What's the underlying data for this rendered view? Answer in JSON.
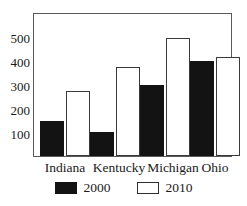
{
  "chart_data": {
    "type": "bar",
    "title": "",
    "subtitle": "",
    "xlabel": "",
    "ylabel": "",
    "categories": [
      "Indiana",
      "Kentucky",
      "Michigan",
      "Ohio"
    ],
    "series": [
      {
        "name": "2000",
        "values": [
          150,
          100,
          300,
          400
        ],
        "color": "#131313",
        "fill": "solid"
      },
      {
        "name": "2010",
        "values": [
          275,
          375,
          500,
          420
        ],
        "color": "#ffffff",
        "fill": "outline"
      }
    ],
    "ylim": [
      0,
      600
    ],
    "yticks": [
      100,
      200,
      300,
      400,
      500
    ],
    "ytick_labels": [
      "100",
      "200",
      "300",
      "400",
      "500"
    ],
    "grid": false,
    "legend_position": "bottom",
    "frame": true
  },
  "axes": {
    "y": {
      "ticks": [
        {
          "label": "500",
          "value": 500
        },
        {
          "label": "400",
          "value": 400
        },
        {
          "label": "300",
          "value": 300
        },
        {
          "label": "200",
          "value": 200
        },
        {
          "label": "100",
          "value": 100
        }
      ]
    },
    "x": {
      "ticks": [
        {
          "label": "Indiana"
        },
        {
          "label": "Kentucky"
        },
        {
          "label": "Michigan"
        },
        {
          "label": "Ohio"
        }
      ]
    }
  },
  "legend": {
    "entries": [
      {
        "label": "2000",
        "swatch": "filled-black-square"
      },
      {
        "label": "2010",
        "swatch": "outlined-white-square"
      }
    ]
  }
}
